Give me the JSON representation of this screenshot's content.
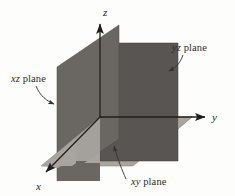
{
  "figure": {
    "type": "3d-coordinate-planes-diagram",
    "background_color": "#fdfdfc"
  },
  "axes": [
    {
      "id": "z",
      "label": "z",
      "direction": "up",
      "label_x": 103,
      "label_y": 16
    },
    {
      "id": "y",
      "label": "y",
      "direction": "right",
      "label_x": 213,
      "label_y": 119
    },
    {
      "id": "x",
      "label": "x",
      "direction": "down-left",
      "label_x": 37,
      "label_y": 188
    }
  ],
  "planes": [
    {
      "id": "yz",
      "label_italic": "yz",
      "label_roman": " plane",
      "color": "#595552",
      "label_x": 173,
      "label_y": 50
    },
    {
      "id": "xz",
      "label_italic": "xz",
      "label_roman": " plane",
      "color": "#6a6763",
      "label_x": 12,
      "label_y": 81
    },
    {
      "id": "xy",
      "label_italic": "xy",
      "label_roman": " plane",
      "color": "#a8a5a0",
      "label_x": 131,
      "label_y": 184
    }
  ],
  "colors": {
    "yz_plane": "#595552",
    "xz_plane": "#6a6763",
    "xy_plane": "#a8a5a0",
    "xy_plane_shadow": "#9a9792",
    "axis": "#211e1b",
    "text": "#2e2b28",
    "leader": "#36322e"
  }
}
